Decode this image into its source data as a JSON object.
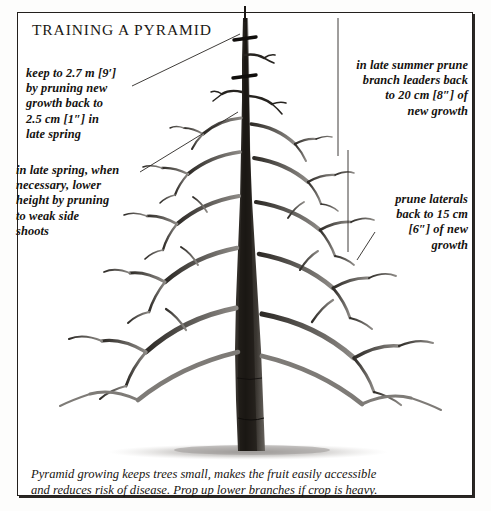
{
  "page": {
    "title": "TRAINING A PYRAMID"
  },
  "colors": {
    "frame": "#23201d",
    "ink": "#15120f",
    "paper": "#ffffff",
    "branch_dark": "#2b2724",
    "branch_mid": "#6d6a67",
    "branch_light": "#a9a6a3",
    "ground": "#b9b6b3"
  },
  "annotations": {
    "height": {
      "name": "keep-to-height-note",
      "lines": [
        "keep to 2.7 m [9′]",
        "by pruning new",
        "growth back to",
        "2.5 cm [1″] in",
        "late spring"
      ]
    },
    "lower_height": {
      "name": "lower-height-note",
      "lines": [
        "in late spring, when",
        "necessary, lower",
        "height by pruning",
        "to weak side",
        "shoots"
      ]
    },
    "summer_prune": {
      "name": "late-summer-prune-note",
      "lines": [
        "in late summer prune",
        "branch leaders back",
        "to 20 cm [8″] of",
        "new growth"
      ]
    },
    "laterals": {
      "name": "prune-laterals-note",
      "lines": [
        "prune laterals",
        "back to 15 cm",
        "[6″] of new",
        "growth"
      ]
    }
  },
  "caption": {
    "lines": [
      "Pyramid growing keeps trees small, makes the fruit easily accessible",
      "and reduces risk of disease. Prop up lower branches if crop is heavy."
    ]
  },
  "illustration": {
    "type": "pen-and-ink-line-drawing",
    "subject": "bare deciduous pyramid-trained fruit tree",
    "elements": [
      "central-leader-trunk",
      "tiered-scaffold-branches",
      "laterals",
      "pruning-cut-marks",
      "ground-shadow"
    ],
    "leader_lines": [
      "height-note-to-upper-leader",
      "lower-height-note-to-mid-trunk",
      "summer-prune-vertical-rule",
      "laterals-vertical-rule",
      "laterals-diagonal-pointer"
    ]
  }
}
